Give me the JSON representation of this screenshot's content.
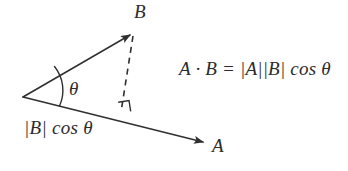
{
  "figure": {
    "background_color": "#ffffff",
    "stroke_color": "#2f2f2f",
    "text_color": "#2c2c2c"
  },
  "labels": {
    "vector_b": "B",
    "vector_a": "A",
    "angle_theta": "θ",
    "projection": "|B| cos θ",
    "formula": "A · B = |A||B| cos θ"
  },
  "geometry": {
    "origin": {
      "x": 23,
      "y": 97
    },
    "vector_a_tip": {
      "x": 207,
      "y": 143
    },
    "vector_b_tip": {
      "x": 133,
      "y": 33
    },
    "projection_foot": {
      "x": 120,
      "y": 113
    },
    "arc_radius": 38,
    "right_angle_marker_size": 11
  },
  "elements": {
    "vector_a_name": "vector-a-arrow",
    "vector_b_name": "vector-b-arrow",
    "dashed_name": "projection-dashed-line",
    "arc_name": "angle-arc",
    "right_angle_name": "right-angle-marker"
  }
}
